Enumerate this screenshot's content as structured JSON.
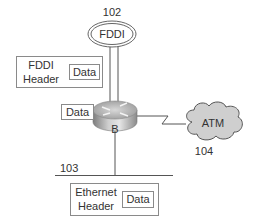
{
  "diagram": {
    "fddi_ring": {
      "label": "FDDI",
      "ref": "102"
    },
    "fddi_frame": {
      "header_line1": "FDDI",
      "header_line2": "Header",
      "data_label": "Data"
    },
    "router": {
      "label": "B",
      "data_label": "Data"
    },
    "atm_cloud": {
      "label": "ATM",
      "ref": "104"
    },
    "ethernet_segment": {
      "ref": "103"
    },
    "ethernet_frame": {
      "header_line1": "Ethernet",
      "header_line2": "Header",
      "data_label": "Data"
    }
  }
}
